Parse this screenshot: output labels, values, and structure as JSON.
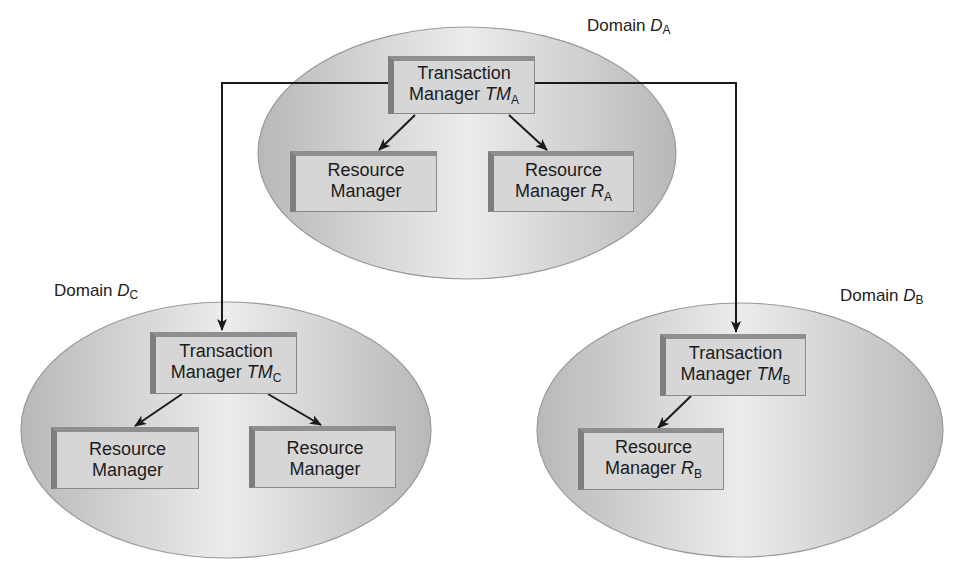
{
  "diagram": {
    "colors": {
      "ellipse_edge": "#9a9a9a",
      "ellipse_fill_dark": "#b5b5b5",
      "ellipse_fill_light": "#ececec",
      "box_face": "#d6d6d6",
      "box_bevel": "#7e7e7e",
      "arrow": "#1a1a1a"
    },
    "domains": [
      {
        "id": "A",
        "label_prefix": "Domain ",
        "label_var": "D",
        "label_sub": "A",
        "transaction_manager": {
          "line1": "Transaction",
          "line2": "Manager ",
          "var": "TM",
          "sub": "A"
        },
        "resource_managers": [
          {
            "line1": "Resource",
            "line2": "Manager",
            "var": "",
            "sub": ""
          },
          {
            "line1": "Resource",
            "line2": "Manager ",
            "var": "R",
            "sub": "A"
          }
        ]
      },
      {
        "id": "C",
        "label_prefix": "Domain ",
        "label_var": "D",
        "label_sub": "C",
        "transaction_manager": {
          "line1": "Transaction",
          "line2": "Manager ",
          "var": "TM",
          "sub": "C"
        },
        "resource_managers": [
          {
            "line1": "Resource",
            "line2": "Manager",
            "var": "",
            "sub": ""
          },
          {
            "line1": "Resource",
            "line2": "Manager",
            "var": "",
            "sub": ""
          }
        ]
      },
      {
        "id": "B",
        "label_prefix": "Domain ",
        "label_var": "D",
        "label_sub": "B",
        "transaction_manager": {
          "line1": "Transaction",
          "line2": "Manager ",
          "var": "TM",
          "sub": "B"
        },
        "resource_managers": [
          {
            "line1": "Resource",
            "line2": "Manager ",
            "var": "R",
            "sub": "B"
          }
        ]
      }
    ],
    "edges": [
      {
        "from": "TM_A",
        "to": "RM_A1"
      },
      {
        "from": "TM_A",
        "to": "RM_A2"
      },
      {
        "from": "TM_A",
        "to": "TM_C"
      },
      {
        "from": "TM_A",
        "to": "TM_B"
      },
      {
        "from": "TM_C",
        "to": "RM_C1"
      },
      {
        "from": "TM_C",
        "to": "RM_C2"
      },
      {
        "from": "TM_B",
        "to": "RM_B1"
      }
    ]
  }
}
